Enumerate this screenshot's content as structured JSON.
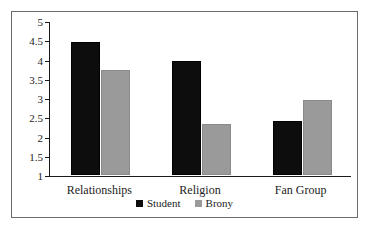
{
  "chart_data": {
    "type": "bar",
    "title": "",
    "xlabel": "",
    "ylabel": "",
    "categories": [
      "Relationships",
      "Religion",
      "Fan Group"
    ],
    "series": [
      {
        "name": "Student",
        "color": "#0d0d0d",
        "values": [
          4.45,
          3.97,
          2.4
        ]
      },
      {
        "name": "Brony",
        "color": "#9a9a9a",
        "values": [
          3.72,
          2.33,
          2.95
        ]
      }
    ],
    "ylim": [
      1,
      5
    ],
    "yticks": [
      "1",
      "1.5",
      "2",
      "2.5",
      "3",
      "3.5",
      "4",
      "4.5",
      "5"
    ],
    "ytick_values": [
      1,
      1.5,
      2,
      2.5,
      3,
      3.5,
      4,
      4.5,
      5
    ],
    "grid": false,
    "legend_position": "bottom",
    "frame": true,
    "frame_color": "#6b6b6b",
    "axis_color": "#1a1a1a",
    "background": "#ffffff"
  }
}
